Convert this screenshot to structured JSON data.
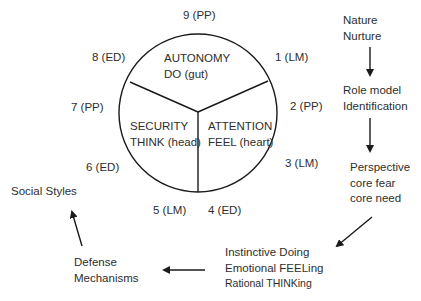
{
  "circle": {
    "sectors": [
      {
        "id": "autonomy",
        "title": "AUTONOMY",
        "subtitle": "DO (gut)"
      },
      {
        "id": "security",
        "title": "SECURITY",
        "subtitle": "THINK (head)"
      },
      {
        "id": "attention",
        "title": "ATTENTION",
        "subtitle": "FEEL (heart)"
      }
    ],
    "points": [
      {
        "label": "9  (PP)"
      },
      {
        "label": "1 (LM)"
      },
      {
        "label": "2  (PP)"
      },
      {
        "label": "3 (LM)"
      },
      {
        "label": "4  (ED)"
      },
      {
        "label": "5  (LM)"
      },
      {
        "label": "6  (ED)"
      },
      {
        "label": "7 (PP)"
      },
      {
        "label": "8 (ED)"
      }
    ]
  },
  "flow": {
    "nature": [
      "Nature",
      "Nurture"
    ],
    "role_model": [
      "Role model",
      "Identification"
    ],
    "perspective": [
      "Perspective",
      "core fear",
      "core need"
    ],
    "modes": [
      "Instinctive Doing",
      "Emotional FEELing",
      "Rational THINKing"
    ],
    "defense": [
      "Defense",
      "Mechanisms"
    ],
    "social": "Social  Styles"
  },
  "colors": {
    "stroke": "#1a1a1a",
    "text": "#2e2e2e",
    "background": "#ffffff"
  }
}
